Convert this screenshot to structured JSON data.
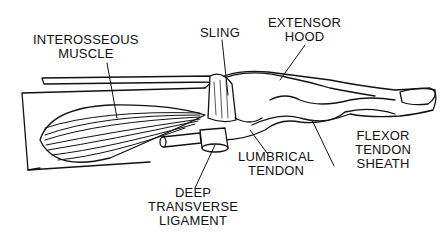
{
  "diagram": {
    "labels": {
      "interosseous_muscle": [
        "INTEROSSEOUS",
        "MUSCLE"
      ],
      "sling": [
        "SLING"
      ],
      "extensor_hood": [
        "EXTENSOR",
        "HOOD"
      ],
      "flexor_tendon_sheath": [
        "FLEXOR",
        "TENDON",
        "SHEATH"
      ],
      "lumbrical_tendon": [
        "LUMBRICAL",
        "TENDON"
      ],
      "deep_transverse_ligament": [
        "DEEP",
        "TRANSVERSE",
        "LIGAMENT"
      ]
    },
    "colors": {
      "background": "#ffffff",
      "ink": "#111111"
    }
  }
}
